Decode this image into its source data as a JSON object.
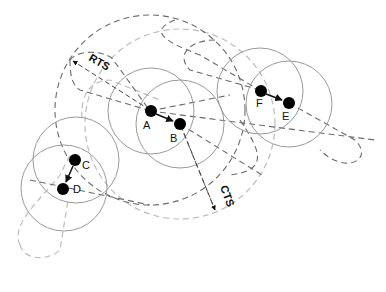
{
  "diagram": {
    "nodes": [
      {
        "id": "A",
        "label": "A",
        "x": 151,
        "y": 111,
        "label_dx": -8,
        "label_dy": 18
      },
      {
        "id": "B",
        "label": "B",
        "x": 180,
        "y": 124,
        "label_dx": -8,
        "label_dy": 18
      },
      {
        "id": "C",
        "label": "C",
        "x": 75,
        "y": 160,
        "label_dx": 7,
        "label_dy": 8
      },
      {
        "id": "D",
        "label": "D",
        "x": 63,
        "y": 189,
        "label_dx": 10,
        "label_dy": 4
      },
      {
        "id": "F",
        "label": "F",
        "x": 261,
        "y": 91,
        "label_dx": -5,
        "label_dy": 17
      },
      {
        "id": "E",
        "label": "E",
        "x": 289,
        "y": 103,
        "label_dx": -7,
        "label_dy": 17
      }
    ],
    "arrows": [
      {
        "from": "A",
        "to": "B"
      },
      {
        "from": "C",
        "to": "D"
      },
      {
        "from": "F",
        "to": "E"
      }
    ],
    "range_labels": {
      "rts": "RTS",
      "cts": "CTS"
    },
    "colors": {
      "node": "#000000",
      "range_circle": "#9a9a9a",
      "rts_dashed": "#555555",
      "cts_dashed": "#b5b5b5"
    }
  }
}
